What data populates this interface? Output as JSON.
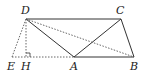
{
  "figure": {
    "type": "geometry",
    "points": {
      "D": {
        "label": "D",
        "x": 26,
        "y": 19
      },
      "C": {
        "label": "C",
        "x": 121,
        "y": 19
      },
      "A": {
        "label": "A",
        "x": 74,
        "y": 57
      },
      "B": {
        "label": "B",
        "x": 134,
        "y": 57
      },
      "E": {
        "label": "E",
        "x": 12,
        "y": 57
      },
      "H": {
        "label": "H",
        "x": 26,
        "y": 57
      }
    },
    "segments_solid": [
      "DC",
      "DA",
      "AC",
      "CB",
      "AB"
    ],
    "segments_dashed": [
      "DB",
      "DE",
      "DH",
      "EA"
    ],
    "right_angle_at": "H",
    "line_color": "#333333"
  }
}
